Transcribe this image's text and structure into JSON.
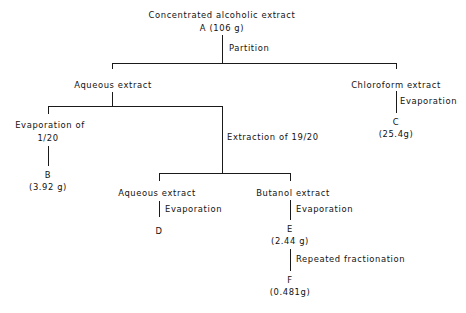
{
  "diagram": {
    "nodes": {
      "root": {
        "label": "Concentrated alcoholic extract",
        "sub": "A (106 g)"
      },
      "aqueous1": {
        "label": "Aqueous extract"
      },
      "chloroform": {
        "label": "Chloroform extract",
        "product": "C",
        "amount": "(25.4g)"
      },
      "evap120": {
        "label": "Evaporation of",
        "label2": "1/20",
        "product": "B",
        "amount": "(3.92 g)"
      },
      "aqueous2": {
        "label": "Aqueous extract",
        "product": "D"
      },
      "butanol": {
        "label": "Butanol extract",
        "product": "E",
        "amount": "(2.44 g)"
      },
      "final": {
        "product": "F",
        "amount": "(0.481g)"
      }
    },
    "edges": {
      "partition": "Partition",
      "chloroform_evap": "Evaporation",
      "extraction": "Extraction of 19/20",
      "aqueous_evap": "Evaporation",
      "butanol_evap": "Evaporation",
      "repeated": "Repeated fractionation"
    }
  }
}
